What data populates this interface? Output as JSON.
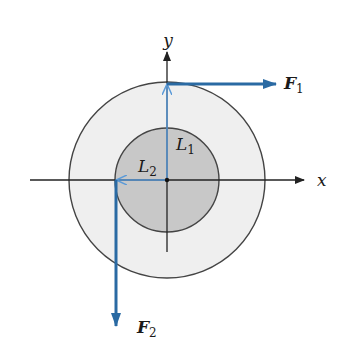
{
  "diagram": {
    "axes": {
      "x_label": "x",
      "y_label": "y"
    },
    "lengths": [
      {
        "symbol": "L",
        "subscript": "1"
      },
      {
        "symbol": "L",
        "subscript": "2"
      }
    ],
    "forces": [
      {
        "symbol": "F",
        "subscript": "1",
        "direction": "right"
      },
      {
        "symbol": "F",
        "subscript": "2",
        "direction": "down"
      }
    ],
    "colors": {
      "force": "#2a6aa3",
      "length_arrow": "#5a9ad8",
      "outer_disk": "#efefef",
      "inner_disk": "#c8c8c8",
      "axis": "#222222"
    }
  }
}
